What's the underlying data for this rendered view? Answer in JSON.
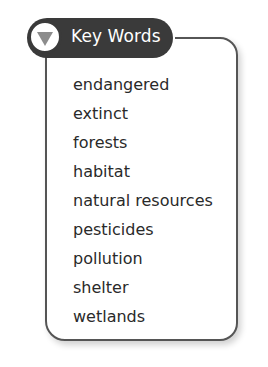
{
  "header": {
    "title": "Key Words",
    "icon": "triangle-down-icon"
  },
  "words": [
    "endangered",
    "extinct",
    "forests",
    "habitat",
    "natural resources",
    "pesticides",
    "pollution",
    "shelter",
    "wetlands"
  ],
  "colors": {
    "header_bg": "#3a3a3a",
    "header_text": "#ffffff",
    "triangle": "#8c8c8c",
    "border": "#555555",
    "text": "#2a2a2a"
  }
}
